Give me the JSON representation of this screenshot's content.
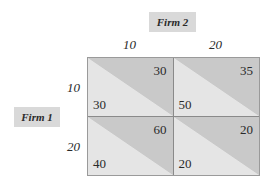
{
  "players": {
    "column_player": "Firm 2",
    "row_player": "Firm 1"
  },
  "strategies": {
    "columns": [
      "10",
      "20"
    ],
    "rows": [
      "10",
      "20"
    ]
  },
  "payoffs": [
    [
      {
        "firm1": "30",
        "firm2": "30"
      },
      {
        "firm1": "50",
        "firm2": "35"
      }
    ],
    [
      {
        "firm1": "40",
        "firm2": "60"
      },
      {
        "firm1": "20",
        "firm2": "20"
      }
    ]
  ],
  "colors": {
    "label_background": "#d9d9d9",
    "cell_light": "#e5e5e5",
    "cell_dark": "#c9c9c9",
    "text": "#2a2a2a"
  }
}
